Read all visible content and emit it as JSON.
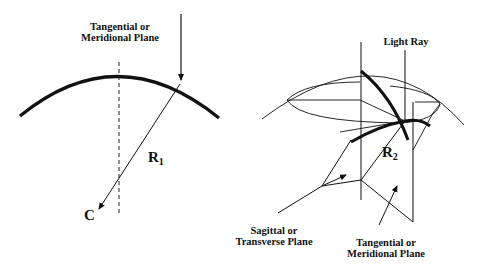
{
  "left_figure": {
    "title": "Tangential / meridional plane cross-section",
    "plane_label": {
      "line1": "Tangential or",
      "line2": "Meridional Plane"
    },
    "radius_label": "R",
    "radius_subscript": "1",
    "center_label": "C"
  },
  "right_figure": {
    "title": "Toroidal surface with two planes",
    "ray_label": "Light Ray",
    "radius_label": "R",
    "radius_subscript": "2",
    "sagittal_label": {
      "line1": "Sagittal or",
      "line2": "Transverse Plane"
    },
    "tangential_label": {
      "line1": "Tangential or",
      "line2": "Meridional Plane"
    }
  },
  "colors": {
    "ink": "#111111",
    "background": "#ffffff"
  }
}
